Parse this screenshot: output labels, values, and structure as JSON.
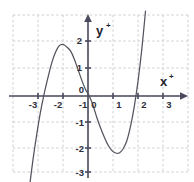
{
  "figure": {
    "name": "cubic-function-graph",
    "background_color": "#ffffff",
    "width": 194,
    "height": 182
  },
  "axes": {
    "x_axis_label": "x",
    "x_axis_label_sup": "+",
    "y_axis_label": "y",
    "y_axis_label_sup": "+",
    "origin_label": "0",
    "axis_color": "#4a4a5e",
    "grid_color": "#c8c8cc",
    "x_ticks": [
      "-3",
      "-2",
      "-1",
      "0",
      "1",
      "2",
      "3"
    ],
    "x_tick_values": [
      -3,
      -2,
      -1,
      0,
      1,
      2,
      3
    ],
    "y_ticks": [
      "2",
      "1",
      "0",
      "-1",
      "-2",
      "-3"
    ],
    "y_tick_values": [
      2,
      1,
      0,
      -1,
      -2,
      -3
    ]
  },
  "chart_data": {
    "type": "line",
    "title": "",
    "xlabel": "x",
    "ylabel": "y",
    "xlim": [
      -3.55,
      3.55
    ],
    "ylim": [
      -3.55,
      2.6
    ],
    "grid": true,
    "grid_style": "dashed",
    "legend": "none",
    "curve_color": "#54545f",
    "function_form": "cubic",
    "approx_equation": "y = 0.55x^3 - 0.30x^2 - 2.10x + 0.10",
    "features": {
      "local_maximum": {
        "x": -1.15,
        "y": 1.9
      },
      "local_minimum": {
        "x": 1.25,
        "y": -2.15
      },
      "x_intercepts": [
        -2.05,
        0.05,
        1.75
      ],
      "y_intercept": 0.1
    },
    "series": [
      {
        "name": "cubic",
        "x": [
          -2.35,
          -2.2,
          -2.05,
          -1.9,
          -1.75,
          -1.6,
          -1.45,
          -1.3,
          -1.15,
          -1.0,
          -0.85,
          -0.7,
          -0.55,
          -0.4,
          -0.25,
          -0.1,
          0.05,
          0.2,
          0.35,
          0.5,
          0.65,
          0.8,
          0.95,
          1.1,
          1.25,
          1.4,
          1.55,
          1.7,
          1.85,
          2.0,
          2.15,
          2.3
        ],
        "y": [
          -3.5,
          -2.4,
          -1.45,
          -0.6,
          0.1,
          0.7,
          1.25,
          1.65,
          1.9,
          1.95,
          1.85,
          1.7,
          1.4,
          1.0,
          0.6,
          0.25,
          0.0,
          -0.35,
          -0.8,
          -1.2,
          -1.55,
          -1.85,
          -2.05,
          -2.15,
          -2.15,
          -2.0,
          -1.7,
          -1.15,
          -0.4,
          0.55,
          1.75,
          3.2
        ]
      }
    ]
  }
}
